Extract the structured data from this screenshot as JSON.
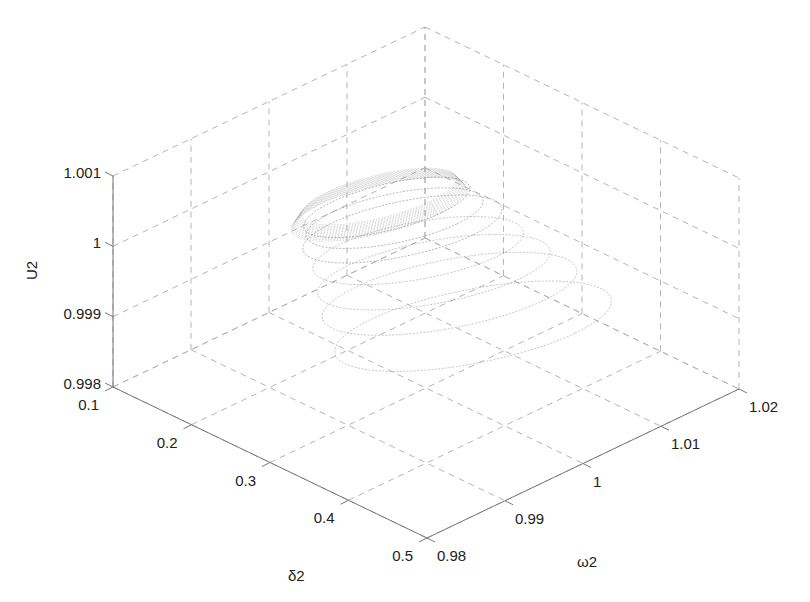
{
  "chart_data": {
    "type": "line3d",
    "title": "",
    "xlabel": "δ2",
    "ylabel": "ω2",
    "zlabel": "U2",
    "x_ticks": [
      "0.1",
      "0.2",
      "0.3",
      "0.4",
      "0.5"
    ],
    "y_ticks": [
      "0.98",
      "0.99",
      "1",
      "1.01",
      "1.02"
    ],
    "z_ticks": [
      "0.998",
      "0.999",
      "1",
      "1.001"
    ],
    "xlim": [
      0.1,
      0.5
    ],
    "ylim": [
      0.98,
      1.02
    ],
    "zlim": [
      0.998,
      1.001
    ],
    "grid": true,
    "series": [
      {
        "name": "trajectory",
        "description": "Spiraling orbits converging; inner dense ellipse near δ2≈0.25, ω2≈1.0, U2≈1.0004; outer larger loops spread toward δ2≈0.45, U2≈0.9985",
        "color": "#9a9a9a",
        "loops": [
          {
            "cx_delta": 0.25,
            "cy_omega": 1.0,
            "cz_u": 1.0003,
            "r_delta": 0.07,
            "r_omega": 0.008,
            "r_u": 0.0003
          },
          {
            "cx_delta": 0.26,
            "cy_omega": 1.0,
            "cz_u": 1.0002,
            "r_delta": 0.08,
            "r_omega": 0.008,
            "r_u": 0.00035
          },
          {
            "cx_delta": 0.27,
            "cy_omega": 1.0,
            "cz_u": 1.0001,
            "r_delta": 0.09,
            "r_omega": 0.009,
            "r_u": 0.0004
          },
          {
            "cx_delta": 0.29,
            "cy_omega": 1.0,
            "cz_u": 0.9999,
            "r_delta": 0.1,
            "r_omega": 0.009,
            "r_u": 0.00045
          },
          {
            "cx_delta": 0.31,
            "cy_omega": 1.0,
            "cz_u": 0.9997,
            "r_delta": 0.11,
            "r_omega": 0.01,
            "r_u": 0.0005
          },
          {
            "cx_delta": 0.33,
            "cy_omega": 1.0,
            "cz_u": 0.9995,
            "r_delta": 0.12,
            "r_omega": 0.011,
            "r_u": 0.00055
          },
          {
            "cx_delta": 0.36,
            "cy_omega": 1.0,
            "cz_u": 0.9992,
            "r_delta": 0.13,
            "r_omega": 0.012,
            "r_u": 0.0006
          }
        ]
      }
    ]
  },
  "labels": {
    "x_axis": "δ2",
    "y_axis": "ω2",
    "z_axis": "U2"
  }
}
